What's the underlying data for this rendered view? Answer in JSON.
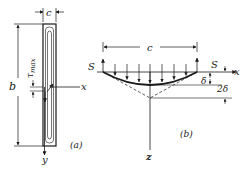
{
  "figure_a": {
    "caption": "(a)",
    "width_label": "c",
    "height_label": "b",
    "stress_label": "τ",
    "stress_subscript": "max",
    "x_axis_label": "x",
    "y_axis_label": "y"
  },
  "figure_b": {
    "caption": "(b)",
    "span_label": "c",
    "left_force_label": "S",
    "right_force_label": "S",
    "x_axis_label": "x",
    "z_axis_label": "z",
    "deflection_label": "δ",
    "double_deflection_label": "2δ"
  },
  "colors": {
    "ink": "#1a1a1a",
    "background": "#ffffff"
  }
}
